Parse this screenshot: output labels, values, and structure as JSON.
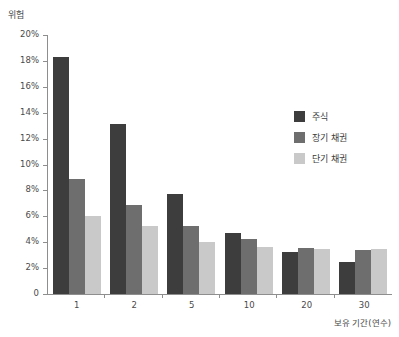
{
  "chart_data": {
    "type": "bar",
    "title": "",
    "ylabel": "위험",
    "xlabel": "보유 기간(연수)",
    "categories": [
      "1",
      "2",
      "5",
      "10",
      "20",
      "30"
    ],
    "series": [
      {
        "name": "주식",
        "color": "#3d3d3d",
        "values": [
          18.3,
          13.1,
          7.7,
          4.7,
          3.25,
          2.5
        ]
      },
      {
        "name": "장기 채권",
        "color": "#6e6e6e",
        "values": [
          8.9,
          6.9,
          5.25,
          4.25,
          3.55,
          3.4
        ]
      },
      {
        "name": "단기 채권",
        "color": "#c9c9c9",
        "values": [
          6.0,
          5.25,
          4.0,
          3.6,
          3.5,
          3.5
        ]
      }
    ],
    "ylim": [
      0,
      20
    ],
    "yticks": [
      "0",
      "2%",
      "4%",
      "6%",
      "8%",
      "10%",
      "12%",
      "14%",
      "16%",
      "18%",
      "20%"
    ],
    "ytick_values": [
      0,
      2,
      4,
      6,
      8,
      10,
      12,
      14,
      16,
      18,
      20
    ],
    "grid": false,
    "legend_position": "right"
  }
}
